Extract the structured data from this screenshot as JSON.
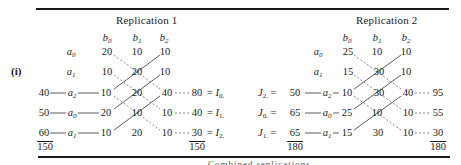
{
  "figure": {
    "label": "(i)",
    "caption_partial": "Combined replications"
  },
  "replications": [
    {
      "title": "Replication 1",
      "col_headers": [
        "b0",
        "b1",
        "b2"
      ],
      "grid": [
        {
          "row": "a0",
          "cells": [
            "20",
            "10",
            "10"
          ]
        },
        {
          "row": "a1",
          "cells": [
            "10",
            "20",
            "10"
          ]
        },
        {
          "row": "a2",
          "left_total": "40",
          "cells": [
            "10",
            "20",
            "40"
          ],
          "right_total": "80",
          "right_label": "I0."
        },
        {
          "row": "a0",
          "left_total": "50",
          "cells": [
            "20",
            "10",
            "10"
          ],
          "right_total": "40",
          "right_label": "I1."
        },
        {
          "row": "a1",
          "left_total": "60",
          "cells": [
            "10",
            "20",
            "10"
          ],
          "right_total": "30",
          "right_label": "I2."
        }
      ],
      "left_grand_total": "150",
      "right_grand_total": "150"
    },
    {
      "title": "Replication 2",
      "col_headers": [
        "b0",
        "b1",
        "b2"
      ],
      "grid": [
        {
          "row": "a0",
          "cells": [
            "25",
            "10",
            "10"
          ]
        },
        {
          "row": "a1",
          "cells": [
            "15",
            "30",
            "10"
          ]
        },
        {
          "row": "a2",
          "left_label": "J2.",
          "left_total": "50",
          "cells": [
            "10",
            "30",
            "40"
          ],
          "right_total": "95"
        },
        {
          "row": "a0",
          "left_label": "J0.",
          "left_total": "65",
          "cells": [
            "25",
            "10",
            "10"
          ],
          "right_total": "55"
        },
        {
          "row": "a1",
          "left_label": "J1.",
          "left_total": "65",
          "cells": [
            "15",
            "30",
            "10"
          ],
          "right_total": "30"
        }
      ],
      "left_grand_total": "180",
      "right_grand_total": "180"
    }
  ]
}
